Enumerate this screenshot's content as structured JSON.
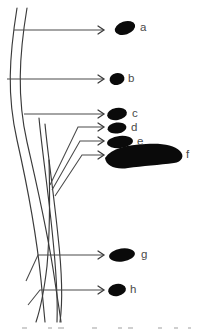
{
  "figure": {
    "background_color": "#ffffff",
    "blob_color": "#0a0a0a",
    "line_color": "#3a3a3a",
    "label_color": "#4a4a4a",
    "width": 199,
    "height": 331
  },
  "labels": {
    "a": "a",
    "b": "b",
    "c": "c",
    "d": "d",
    "e": "e",
    "f": "f",
    "g": "g",
    "h": "h"
  },
  "structures": [
    {
      "id": "a",
      "label": "a",
      "shape": "ellipse",
      "cx": 125,
      "cy": 28,
      "rx": 10.5,
      "ry": 6.5,
      "rotation": -18,
      "label_x": 140,
      "label_y": 28
    },
    {
      "id": "b",
      "label": "b",
      "shape": "ellipse",
      "cx": 117,
      "cy": 79,
      "rx": 7.5,
      "ry": 6.0,
      "rotation": -12,
      "label_x": 128,
      "label_y": 79
    },
    {
      "id": "c",
      "label": "c",
      "shape": "ellipse",
      "cx": 117,
      "cy": 114,
      "rx": 10.0,
      "ry": 6.0,
      "rotation": -10,
      "label_x": 132,
      "label_y": 114
    },
    {
      "id": "d",
      "label": "d",
      "shape": "ellipse",
      "cx": 117,
      "cy": 128,
      "rx": 9.5,
      "ry": 5.5,
      "rotation": -8,
      "label_x": 131,
      "label_y": 128
    },
    {
      "id": "e",
      "label": "e",
      "shape": "ellipse",
      "cx": 120,
      "cy": 142,
      "rx": 13.0,
      "ry": 6.0,
      "rotation": -6,
      "label_x": 137,
      "label_y": 142
    },
    {
      "id": "f",
      "label": "f",
      "shape": "crescent",
      "label_x": 186,
      "label_y": 155
    },
    {
      "id": "g",
      "label": "g",
      "shape": "ellipse",
      "cx": 122,
      "cy": 255,
      "rx": 13.0,
      "ry": 6.5,
      "rotation": -8,
      "label_x": 141,
      "label_y": 255
    },
    {
      "id": "h",
      "label": "h",
      "shape": "ellipse",
      "cx": 117,
      "cy": 290,
      "rx": 9.0,
      "ry": 6.0,
      "rotation": -10,
      "label_x": 130,
      "label_y": 290
    }
  ],
  "leaders": [
    {
      "id": "a",
      "path": "M 14 30 L 103 30"
    },
    {
      "id": "b",
      "path": "M 7 79 L 103 79"
    },
    {
      "id": "c",
      "path": "M 24 114 L 103 114"
    },
    {
      "id": "d",
      "path": "M 50 185 L 78 127 L 103 127"
    },
    {
      "id": "e",
      "path": "M 52 190 L 80 141 L 103 141"
    },
    {
      "id": "f",
      "path": "M 55 196 L 82 155 L 103 155"
    },
    {
      "id": "g",
      "path": "M 26 281 L 38 255 L 103 255"
    },
    {
      "id": "h",
      "path": "M 28 305 L 40 290 L 103 290"
    }
  ],
  "tracts": [
    {
      "id": "tract-1",
      "path": "M 17 8 C 9 58, 7 96, 17 140 C 26 180, 36 230, 41 280 C 43 300, 44 312, 45 322"
    },
    {
      "id": "tract-2",
      "path": "M 27 8 C 19 56, 17 98, 27 142 C 36 182, 48 232, 55 282 C 58 302, 60 314, 61 322"
    },
    {
      "id": "tract-3",
      "path": "M 39 118 C 42 150, 48 190, 52 230 C 56 268, 58 296, 57 322"
    },
    {
      "id": "tract-4",
      "path": "M 45 124 C 48 156, 54 196, 58 236 C 62 272, 63 300, 60 322"
    },
    {
      "id": "tract-5",
      "path": "M 49 160 C 50 196, 50 232, 47 266 C 44 292, 40 310, 36 322"
    }
  ],
  "caption": {
    "visible_fragment": ""
  }
}
